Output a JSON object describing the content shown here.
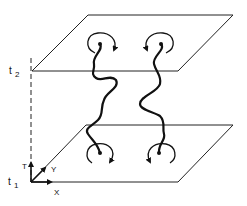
{
  "diagram": {
    "time_labels": {
      "t1": "t",
      "t1_sub": "1",
      "t2": "t",
      "t2_sub": "2"
    },
    "axes": {
      "time": "T",
      "x": "X",
      "y": "Y"
    },
    "planes": [
      "t2-plane",
      "t1-plane"
    ],
    "worldlines": 2,
    "rotation_arrows": {
      "top_left": "clockwise",
      "top_right": "counterclockwise",
      "bottom_left": "clockwise",
      "bottom_right": "counterclockwise"
    },
    "colors": {
      "ink": "#111111",
      "background": "#ffffff"
    }
  }
}
